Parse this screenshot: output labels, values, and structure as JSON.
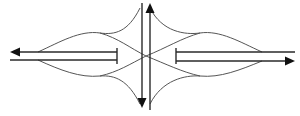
{
  "diagram": {
    "title": "",
    "type": "intersection-lane-flow",
    "colors": {
      "background": "#ffffff",
      "main_line": "#2a2a2a",
      "curve_line": "#555555",
      "arrowhead": "#111111"
    },
    "lanes": {
      "west_outbound": {
        "direction": "left",
        "has_arrow": true
      },
      "west_inbound": {
        "direction": "none",
        "has_arrow": false
      },
      "east_inbound": {
        "direction": "none",
        "has_arrow": false
      },
      "east_outbound": {
        "direction": "right",
        "has_arrow": true
      },
      "north_outbound": {
        "direction": "up",
        "has_arrow": true
      },
      "south_outbound": {
        "direction": "down",
        "has_arrow": true
      }
    },
    "stop_bars": [
      "west",
      "east"
    ],
    "labels": []
  }
}
